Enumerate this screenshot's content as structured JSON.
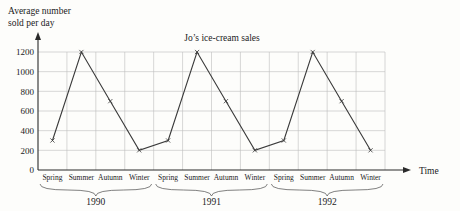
{
  "chart_data": {
    "type": "line",
    "title": "Jo’s ice-cream sales",
    "ylabel_line1": "Average number",
    "ylabel_line2": "sold per day",
    "xlabel": "Time",
    "categories": [
      "Spring",
      "Summer",
      "Autumn",
      "Winter",
      "Spring",
      "Summer",
      "Autumn",
      "Winter",
      "Spring",
      "Summer",
      "Autumn",
      "Winter"
    ],
    "group_labels": [
      "1990",
      "1991",
      "1992"
    ],
    "values": [
      300,
      1200,
      700,
      200,
      300,
      1200,
      700,
      200,
      300,
      1200,
      700,
      200
    ],
    "ytick_labels": [
      "0",
      "200",
      "400",
      "600",
      "800",
      "1000",
      "1200"
    ],
    "ytick_values": [
      0,
      200,
      400,
      600,
      800,
      1000,
      1200
    ],
    "ylim": [
      0,
      1300
    ],
    "grid": true,
    "legend": "none",
    "marker": "x",
    "line_color": "#3a3a3a",
    "grid_color": "#bdbdbd",
    "axis_color": "#2a2a2a",
    "background_color": "#fdfdfb"
  }
}
